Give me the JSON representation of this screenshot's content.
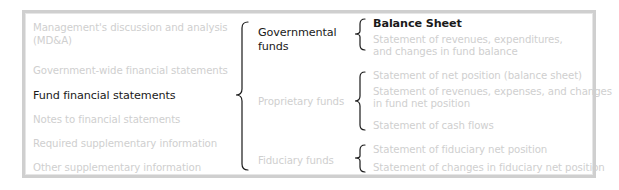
{
  "left_column": {
    "items": [
      {
        "label_line1": "Management's discussion and analysis",
        "label_line2": "(MD&A)",
        "active": false
      },
      {
        "label": "Government-wide financial statements",
        "active": false
      },
      {
        "label": "Fund financial statements",
        "active": true
      },
      {
        "label": "Notes to financial statements",
        "active": false
      },
      {
        "label": "Required supplementary information",
        "active": false
      },
      {
        "label": "Other supplementary information",
        "active": false
      }
    ]
  },
  "fund_types": {
    "items": [
      {
        "label_line1": "Governmental",
        "label_line2": "funds",
        "active": true
      },
      {
        "label": "Proprietary funds",
        "active": false
      },
      {
        "label": "Fiduciary funds",
        "active": false
      }
    ]
  },
  "statements": {
    "governmental": [
      {
        "label": "Balance Sheet",
        "active": true
      },
      {
        "label_line1": "Statement of revenues, expenditures,",
        "label_line2": "and changes in fund balance",
        "active": false
      }
    ],
    "proprietary": [
      {
        "label": "Statement of net position (balance sheet)",
        "active": false
      },
      {
        "label_line1": "Statement of revenues, expenses, and changes",
        "label_line2": "in fund net position",
        "active": false
      },
      {
        "label": "Statement of cash flows",
        "active": false
      }
    ],
    "fiduciary": [
      {
        "label": "Statement of fiduciary net position",
        "active": false
      },
      {
        "label": "Statement of changes in fiduciary net position",
        "active": false
      }
    ]
  },
  "colors": {
    "active_text": "#1a1a1a",
    "inactive_text": "#cfcfcf",
    "frame_border": "#cfcfcf",
    "brace": "#1a1a1a"
  }
}
